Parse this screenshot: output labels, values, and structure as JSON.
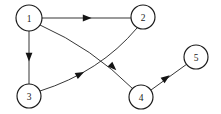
{
  "figure": {
    "kind": "directed-graph",
    "width": 221,
    "height": 114,
    "background_color": "#ffffff",
    "node_fill_color": "#ffffff",
    "node_stroke_color": "#1a1a1a",
    "edge_color": "#2b2b2b",
    "arrow_color": "#141414",
    "label_color": "#1a1a1a"
  },
  "nodes": [
    {
      "id": "1",
      "label": "1",
      "cx": 29,
      "cy": 18,
      "r": 13
    },
    {
      "id": "2",
      "label": "2",
      "cx": 143,
      "cy": 17,
      "r": 12
    },
    {
      "id": "3",
      "label": "3",
      "cx": 29,
      "cy": 96,
      "r": 12
    },
    {
      "id": "4",
      "label": "4",
      "cx": 141,
      "cy": 97,
      "r": 12
    },
    {
      "id": "5",
      "label": "5",
      "cx": 196,
      "cy": 57,
      "r": 12
    }
  ],
  "edges": [
    {
      "id": "edge-1-2",
      "from": "1",
      "to": "2",
      "shape": "straight",
      "path": "M 42 18 L 131 18",
      "arrow": {
        "x": 87,
        "y": 18,
        "angle": 0
      }
    },
    {
      "id": "edge-1-3",
      "from": "1",
      "to": "3",
      "shape": "straight",
      "path": "M 29 31 L 29 84",
      "arrow": {
        "x": 29,
        "y": 57,
        "angle": 90
      }
    },
    {
      "id": "edge-1-4",
      "from": "1",
      "to": "4",
      "shape": "curved",
      "path": "M 40 25 Q 92 48 133 89",
      "arrow": {
        "x": 113,
        "y": 67,
        "angle": 44
      }
    },
    {
      "id": "edge-3-2",
      "from": "3",
      "to": "2",
      "shape": "curved",
      "path": "M 40 91 Q 100 72 137 28",
      "arrow": {
        "x": 80,
        "y": 74,
        "angle": -27
      }
    },
    {
      "id": "edge-4-5",
      "from": "4",
      "to": "5",
      "shape": "straight",
      "path": "M 151 90 L 187 64",
      "arrow": {
        "x": 166,
        "y": 78,
        "angle": -36
      }
    }
  ]
}
